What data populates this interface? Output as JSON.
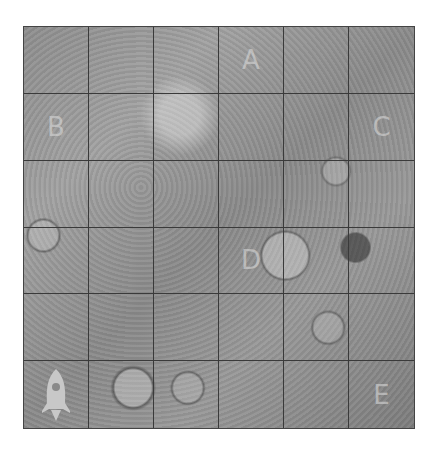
{
  "board": {
    "rows": 6,
    "cols": 6,
    "cells": [
      [
        {
          "label": ""
        },
        {
          "label": ""
        },
        {
          "label": ""
        },
        {
          "label": "A"
        },
        {
          "label": ""
        },
        {
          "label": ""
        }
      ],
      [
        {
          "label": "B"
        },
        {
          "label": ""
        },
        {
          "label": ""
        },
        {
          "label": ""
        },
        {
          "label": ""
        },
        {
          "label": "C"
        }
      ],
      [
        {
          "label": ""
        },
        {
          "label": ""
        },
        {
          "label": ""
        },
        {
          "label": ""
        },
        {
          "label": ""
        },
        {
          "label": ""
        }
      ],
      [
        {
          "label": ""
        },
        {
          "label": ""
        },
        {
          "label": ""
        },
        {
          "label": "D"
        },
        {
          "label": ""
        },
        {
          "label": ""
        }
      ],
      [
        {
          "label": ""
        },
        {
          "label": ""
        },
        {
          "label": ""
        },
        {
          "label": ""
        },
        {
          "label": ""
        },
        {
          "label": ""
        }
      ],
      [
        {
          "label": "",
          "icon": "rocket-icon"
        },
        {
          "label": ""
        },
        {
          "label": ""
        },
        {
          "label": ""
        },
        {
          "label": ""
        },
        {
          "label": "E"
        }
      ]
    ],
    "rocket": {
      "row": 5,
      "col": 0,
      "icon": "rocket-icon",
      "color": "#c8c8c8"
    },
    "grid_line_color": "#3a3a3a",
    "terrain": "lunar-crater-surface"
  }
}
